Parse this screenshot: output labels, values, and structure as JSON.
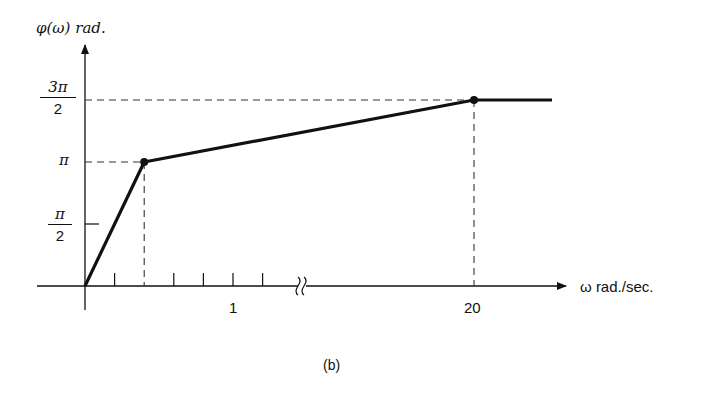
{
  "chart_data": {
    "type": "line",
    "title": "",
    "caption": "(b)",
    "ylabel": "φ(ω)  rad.",
    "xlabel": "ω  rad./sec.",
    "x_tick_labels": [
      "1",
      "20"
    ],
    "y_tick_labels": [
      {
        "num": "π",
        "den": "2",
        "label": "π/2"
      },
      {
        "num": "π",
        "den": "",
        "label": "π"
      },
      {
        "num": "3π",
        "den": "2",
        "label": "3π/2"
      }
    ],
    "x_axis_break": true,
    "series": [
      {
        "name": "phase",
        "points": [
          {
            "x": 0,
            "y_rad_over_pi": 0
          },
          {
            "x": 0.4,
            "y_rad_over_pi": 1.0
          },
          {
            "x": 20,
            "y_rad_over_pi": 1.5
          },
          {
            "x": 60,
            "y_rad_over_pi": 1.5
          }
        ]
      }
    ],
    "breakpoints_marked": [
      {
        "x": 0.4,
        "y_rad_over_pi": 1.0
      },
      {
        "x": 20,
        "y_rad_over_pi": 1.5
      }
    ],
    "minor_x_ticks": [
      0.2,
      0.4,
      0.6,
      0.8,
      1.0,
      1.2
    ],
    "ylim_rad_over_pi": [
      0,
      1.5
    ],
    "grid": false,
    "legend": "none"
  }
}
